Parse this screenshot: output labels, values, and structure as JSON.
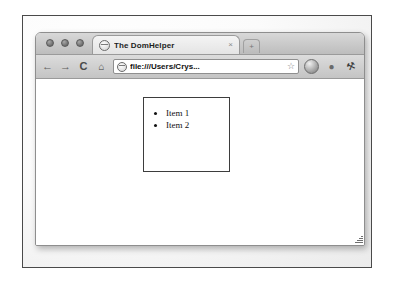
{
  "browser": {
    "window_controls": [
      {
        "name": "close",
        "color": "#6f6f6f"
      },
      {
        "name": "minimize",
        "color": "#6f6f6f"
      },
      {
        "name": "zoom",
        "color": "#6f6f6f"
      }
    ],
    "tab": {
      "title": "The DomHelper",
      "favicon": "globe-icon",
      "close_label": "×"
    },
    "new_tab_label": "+",
    "toolbar": {
      "back_label": "←",
      "forward_label": "→",
      "reload_label": "C",
      "home_label": "⌂",
      "omnibox": {
        "url": "file:///Users/Crys...",
        "favicon": "globe-icon",
        "bookmark_label": "☆"
      },
      "page_menu_label": "",
      "bulb_label": "●",
      "wrench_label": "⚒"
    }
  },
  "page": {
    "list_items": [
      "Item 1",
      "Item 2"
    ]
  },
  "colors": {
    "frame_border": "#4a4a4a",
    "chrome_top": "#d8d8d8",
    "chrome_bottom": "#bdbdbd",
    "page_background": "#ffffff",
    "box_border": "#3d3d3d",
    "text": "#111111"
  }
}
